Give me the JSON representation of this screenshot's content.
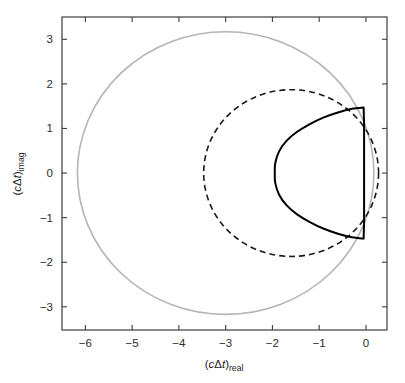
{
  "figure": {
    "title": "",
    "background": "#ffffff"
  },
  "axes": {
    "x": {
      "label_parts": {
        "open": "(",
        "italic_c": "c",
        "delta": "Δ",
        "italic_t": "t",
        "close": ")",
        "subscript": "real"
      },
      "label_text": "(cΔt)real",
      "ticks": [
        "−6",
        "−5",
        "−4",
        "−3",
        "−2",
        "−1",
        "0"
      ],
      "tick_values": [
        -6,
        -5,
        -4,
        -3,
        -2,
        -1,
        0
      ],
      "range": [
        -6.5,
        0.45
      ]
    },
    "y": {
      "label_parts": {
        "open": "(",
        "italic_c": "c",
        "delta": "Δ",
        "italic_t": "t",
        "close": ")",
        "subscript": "imag"
      },
      "label_text": "(cΔt)imag",
      "ticks": [
        "3",
        "2",
        "1",
        "0",
        "−1",
        "−2",
        "−3"
      ],
      "tick_values": [
        3,
        2,
        1,
        0,
        -1,
        -2,
        -3
      ],
      "range": [
        -3.52,
        3.5
      ]
    },
    "frame_color": "#3d3d3d",
    "tick_color": "#3d3d3d"
  },
  "chart_data": {
    "type": "line",
    "title": "",
    "xlabel": "(cΔt)real",
    "ylabel": "(cΔt)imag",
    "xlim": [
      -6.5,
      0.45
    ],
    "ylim": [
      -3.52,
      3.5
    ],
    "grid": false,
    "legend": "none",
    "aspect": "equal-ish",
    "series": [
      {
        "name": "outer-gray-circle",
        "style": "solid",
        "color": "#b5b5b5",
        "linewidth": 1.6,
        "closed": true,
        "shape": "circle",
        "center": [
          -3.0,
          0.0
        ],
        "radius": 3.17,
        "x_extent": [
          -6.17,
          0.17
        ],
        "y_extent": [
          -3.17,
          3.17
        ]
      },
      {
        "name": "dashed-circle",
        "style": "dashed",
        "color": "#1a1a1a",
        "linewidth": 1.6,
        "dasharray": "6,4",
        "closed": true,
        "shape": "circle",
        "center": [
          -1.6,
          0.0
        ],
        "radius": 1.87,
        "x_extent": [
          -3.47,
          0.27
        ],
        "y_extent": [
          -1.87,
          1.87
        ]
      },
      {
        "name": "black-stability-contour",
        "style": "solid",
        "color": "#000000",
        "linewidth": 2.0,
        "closed": true,
        "shape": "d-region",
        "x_extent": [
          -1.95,
          -0.03
        ],
        "y_extent": [
          -1.47,
          1.47
        ],
        "description": "D-shaped closed contour with flat vertical right edge near real = -0.05",
        "points": [
          [
            -0.05,
            1.47
          ],
          [
            -0.3,
            1.44
          ],
          [
            -0.6,
            1.36
          ],
          [
            -0.9,
            1.25
          ],
          [
            -1.2,
            1.1
          ],
          [
            -1.48,
            0.92
          ],
          [
            -1.7,
            0.72
          ],
          [
            -1.86,
            0.48
          ],
          [
            -1.94,
            0.22
          ],
          [
            -1.95,
            0.0
          ],
          [
            -1.94,
            -0.22
          ],
          [
            -1.86,
            -0.48
          ],
          [
            -1.7,
            -0.72
          ],
          [
            -1.48,
            -0.92
          ],
          [
            -1.2,
            -1.1
          ],
          [
            -0.9,
            -1.25
          ],
          [
            -0.6,
            -1.36
          ],
          [
            -0.3,
            -1.44
          ],
          [
            -0.05,
            -1.47
          ],
          [
            -0.04,
            -1.1
          ],
          [
            -0.04,
            -0.55
          ],
          [
            -0.04,
            0.0
          ],
          [
            -0.04,
            0.55
          ],
          [
            -0.04,
            1.1
          ],
          [
            -0.05,
            1.47
          ]
        ]
      }
    ]
  }
}
